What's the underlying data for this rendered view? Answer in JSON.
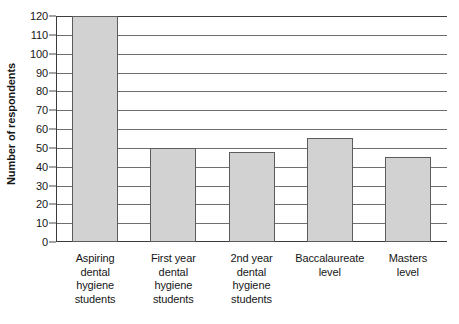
{
  "chart_data": {
    "type": "bar",
    "title": "",
    "xlabel": "",
    "ylabel": "Number of respondents",
    "ylim": [
      0,
      120
    ],
    "ytick_step": 10,
    "yticks": [
      120,
      110,
      100,
      90,
      80,
      70,
      60,
      50,
      40,
      30,
      20,
      10,
      0
    ],
    "grid": true,
    "legend": false,
    "categories": [
      "Aspiring dental hygiene students",
      "First year dental hygiene students",
      "2nd year dental hygiene students",
      "Baccalaureate level",
      "Masters level"
    ],
    "category_lines": [
      [
        "Aspiring",
        "dental",
        "hygiene",
        "students"
      ],
      [
        "First year",
        "dental",
        "hygiene",
        "students"
      ],
      [
        "2nd year",
        "dental",
        "hygiene",
        "students"
      ],
      [
        "Baccalaureate",
        "level"
      ],
      [
        "Masters",
        "level"
      ]
    ],
    "values": [
      120,
      50,
      48,
      55,
      45
    ],
    "colors": {
      "bar_fill": "#d2d2d2",
      "bar_edge": "#5c5c5c",
      "gridline": "#6e6e6e",
      "axis": "#3c3c3c",
      "text": "#161616",
      "background": "#ffffff"
    }
  }
}
